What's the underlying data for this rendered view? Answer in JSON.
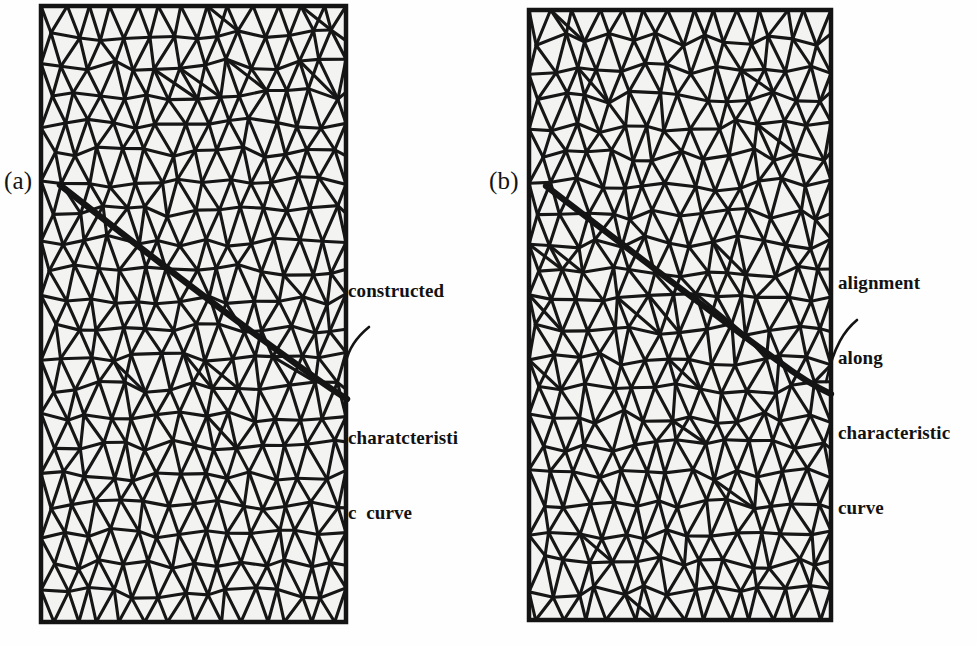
{
  "figure": {
    "type": "mesh-comparison-figure",
    "background_color": "#fefefe",
    "mesh_line_color": "#161616",
    "mesh_fill_color": "#f3f3f1",
    "highlight_curve_color": "#141414"
  },
  "panels": [
    {
      "id": "panel-a",
      "caption": "(a)",
      "mesh": {
        "description": "unstructured triangular mesh, uniform grading",
        "columns": 14,
        "rows": 21,
        "x": 41,
        "y": 6,
        "width": 305,
        "height": 616,
        "aligned_to_curve": false
      },
      "annotation": {
        "lines": [
          "constructed",
          "",
          "charatcteristi",
          "c  curve"
        ],
        "line1": "constructed",
        "line2": "charatcteristi",
        "line3": "c  curve"
      }
    },
    {
      "id": "panel-b",
      "caption": "(b)",
      "mesh": {
        "description": "triangular mesh with edges aligned along the characteristic curve",
        "columns": 14,
        "rows": 21,
        "x": 529,
        "y": 10,
        "width": 302,
        "height": 610,
        "aligned_to_curve": true
      },
      "annotation": {
        "lines": [
          "alignment",
          "along",
          "characteristic",
          "curve"
        ],
        "line1": "alignment",
        "line2": "along",
        "line3": "characteristic",
        "line4": "curve"
      }
    }
  ],
  "chart_data": {
    "type": "diagram",
    "title": "",
    "panels": [
      {
        "label": "(a)",
        "content": "triangular finite-element mesh with a constructed characteristic curve drawn across it",
        "characteristic_curve": {
          "style": "thick smooth curve crossing mesh edges",
          "start": [
            60,
            185
          ],
          "end": [
            347,
            399
          ],
          "control_points": [
            [
              150,
              262
            ],
            [
              250,
              330
            ],
            [
              320,
              372
            ]
          ]
        },
        "leader_line": {
          "from": [
            368,
            325
          ],
          "to": [
            347,
            362
          ]
        }
      },
      {
        "label": "(b)",
        "content": "triangular finite-element mesh whose element edges are aligned along the characteristic curve",
        "characteristic_curve": {
          "style": "thick polyline following mesh edges",
          "start": [
            546,
            186
          ],
          "end": [
            832,
            392
          ],
          "control_points": [
            [
              640,
              255
            ],
            [
              740,
              325
            ],
            [
              800,
              370
            ]
          ]
        },
        "leader_line": {
          "from": [
            856,
            318
          ],
          "to": [
            824,
            382
          ]
        }
      }
    ]
  }
}
